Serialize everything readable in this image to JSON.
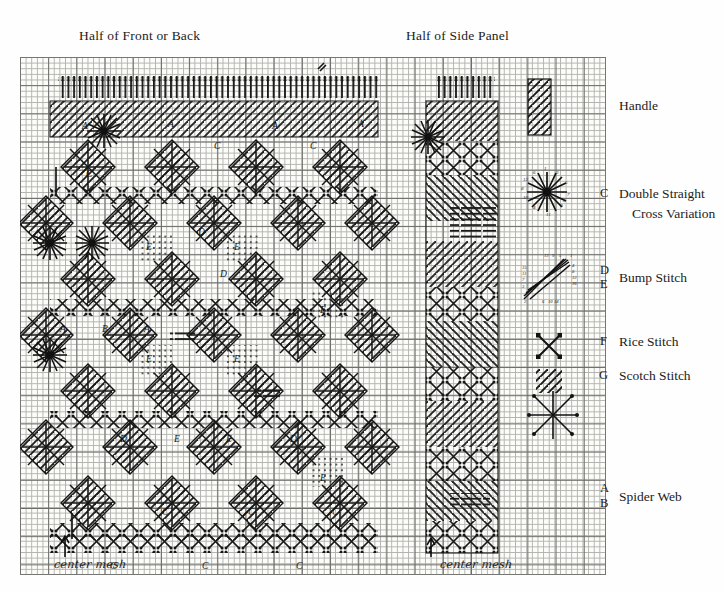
{
  "document": {
    "type": "needlepoint-stitch-chart",
    "background_color": "#fefefe",
    "ink_color": "#1a1a1a"
  },
  "panels": {
    "front_or_back": {
      "title": "Half of Front or Back"
    },
    "side": {
      "title": "Half of Side Panel"
    }
  },
  "annotations": {
    "center_mesh_front": "center mesh",
    "center_mesh_side": "center mesh",
    "arrow_glyph": "↑"
  },
  "legend": {
    "items": [
      {
        "keys": "",
        "label": "Handle",
        "swatch": "diagonal-hatch-block"
      },
      {
        "keys": "C",
        "label": "Double Straight",
        "swatch": "star-burst"
      },
      {
        "keys": "",
        "label": "Cross Variation",
        "swatch": ""
      },
      {
        "keys": "D\nE",
        "label": "Bump Stitch",
        "swatch": "converging-diagonals"
      },
      {
        "keys": "F",
        "label": "Rice Stitch",
        "swatch": "x-with-corner-ticks"
      },
      {
        "keys": "G",
        "label": "Scotch Stitch",
        "swatch": "diagonal-hatch-square"
      },
      {
        "keys": "A\nB",
        "label": "Spider Web",
        "swatch": "eight-ray-asterisk"
      }
    ],
    "handle_label": "Handle",
    "double_straight_label": "Double Straight",
    "cross_variation_label": "Cross Variation",
    "bump_stitch_label": "Bump Stitch",
    "rice_stitch_label": "Rice Stitch",
    "scotch_stitch_label": "Scotch Stitch",
    "spider_web_label": "Spider Web",
    "key_c": "C",
    "key_d": "D",
    "key_e": "E",
    "key_f": "F",
    "key_g": "G",
    "key_a": "A",
    "key_b": "B"
  },
  "chart_marks": {
    "front_letters": [
      "A",
      "B",
      "C",
      "D",
      "E",
      "F",
      "G"
    ],
    "numbers_double_straight": [
      "1",
      "2",
      "3",
      "4",
      "5",
      "6",
      "7",
      "8",
      "9",
      "10",
      "11",
      "12"
    ],
    "numbers_bump": [
      "1",
      "3",
      "5",
      "7",
      "9",
      "11",
      "13",
      "15",
      "2",
      "4",
      "6",
      "8",
      "10",
      "12",
      "14",
      "16"
    ]
  },
  "grid": {
    "cell_px": 5.64,
    "heavy_every": 5,
    "fine_line_color": "#9a9a9a",
    "heavy_line_color": "#3a3a3a"
  }
}
